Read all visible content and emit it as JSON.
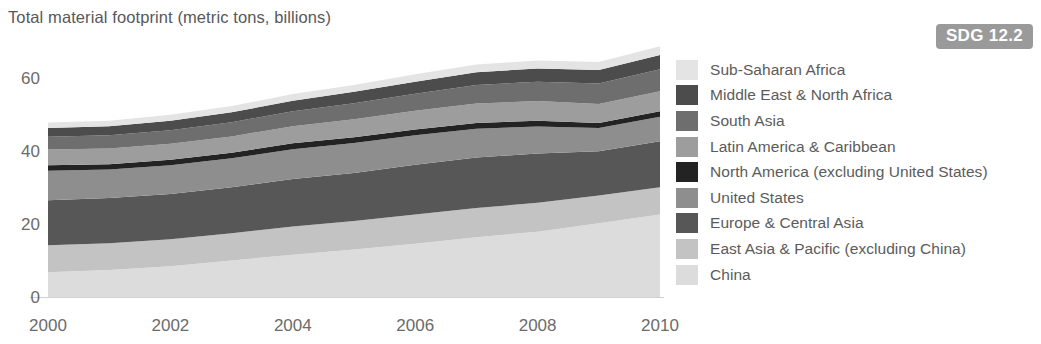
{
  "chart_data": {
    "type": "area",
    "stacked": true,
    "title": "Total material footprint (metric tons, billions)",
    "xlabel": "",
    "ylabel": "",
    "x": [
      2000,
      2001,
      2002,
      2003,
      2004,
      2005,
      2006,
      2007,
      2008,
      2009,
      2010
    ],
    "xlim": [
      2000,
      2010
    ],
    "ylim": [
      0,
      70
    ],
    "yticks": [
      0,
      20,
      40,
      60
    ],
    "xticks": [
      2000,
      2002,
      2004,
      2006,
      2008,
      2010
    ],
    "grid": false,
    "legend_position": "right",
    "series": [
      {
        "name": "China",
        "color": "#dcdcdc",
        "values": [
          6.8,
          7.4,
          8.4,
          10.0,
          11.6,
          13.0,
          14.6,
          16.4,
          17.9,
          20.2,
          22.6
        ]
      },
      {
        "name": "East Asia & Pacific (excluding China)",
        "color": "#c3c3c3",
        "values": [
          7.4,
          7.3,
          7.4,
          7.5,
          7.7,
          7.8,
          8.0,
          8.0,
          7.9,
          7.6,
          7.5
        ]
      },
      {
        "name": "Europe & Central Asia",
        "color": "#575757",
        "values": [
          12.3,
          12.4,
          12.4,
          12.6,
          13.0,
          13.2,
          13.6,
          13.8,
          13.5,
          12.1,
          12.6
        ]
      },
      {
        "name": "United States",
        "color": "#8e8e8e",
        "values": [
          8.1,
          7.8,
          7.9,
          7.9,
          8.2,
          8.2,
          8.1,
          7.9,
          7.4,
          6.4,
          6.7
        ]
      },
      {
        "name": "North America (excluding United States)",
        "color": "#232323",
        "values": [
          1.5,
          1.5,
          1.5,
          1.5,
          1.6,
          1.6,
          1.6,
          1.6,
          1.6,
          1.4,
          1.5
        ]
      },
      {
        "name": "Latin America & Caribbean",
        "color": "#9d9d9d",
        "values": [
          4.3,
          4.3,
          4.4,
          4.5,
          4.7,
          4.9,
          5.1,
          5.3,
          5.4,
          5.2,
          5.5
        ]
      },
      {
        "name": "South Asia",
        "color": "#6e6e6e",
        "values": [
          3.5,
          3.6,
          3.7,
          3.9,
          4.1,
          4.4,
          4.7,
          5.1,
          5.3,
          5.6,
          6.0
        ]
      },
      {
        "name": "Middle East & North Africa",
        "color": "#4c4c4c",
        "values": [
          2.4,
          2.5,
          2.6,
          2.7,
          2.9,
          3.1,
          3.3,
          3.5,
          3.6,
          3.7,
          3.9
        ]
      },
      {
        "name": "Sub-Saharan Africa",
        "color": "#e4e4e4",
        "values": [
          1.5,
          1.5,
          1.6,
          1.7,
          1.8,
          1.9,
          2.0,
          2.1,
          2.2,
          2.2,
          2.4
        ]
      }
    ]
  },
  "badge": {
    "label": "SDG 12.2"
  },
  "legend": {
    "items": [
      {
        "label": "Sub-Saharan Africa",
        "color": "#e4e4e4"
      },
      {
        "label": "Middle East & North Africa",
        "color": "#4c4c4c"
      },
      {
        "label": "South Asia",
        "color": "#6e6e6e"
      },
      {
        "label": "Latin America & Caribbean",
        "color": "#9d9d9d"
      },
      {
        "label": "North America (excluding United States)",
        "color": "#232323"
      },
      {
        "label": "United States",
        "color": "#8e8e8e"
      },
      {
        "label": "Europe & Central Asia",
        "color": "#575757"
      },
      {
        "label": "East Asia & Pacific (excluding China)",
        "color": "#c3c3c3"
      },
      {
        "label": "China",
        "color": "#dcdcdc"
      }
    ]
  }
}
